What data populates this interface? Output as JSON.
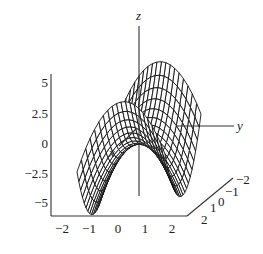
{
  "chart_data": {
    "type": "surface3d",
    "title": "",
    "function": "z = y^2 - x^2 (saddle / hyperbolic paraboloid)",
    "axes": {
      "x": {
        "label": "x",
        "ticks": [
          "2",
          "1",
          "0",
          "−1",
          "−2"
        ],
        "range": [
          -2,
          2
        ]
      },
      "y": {
        "label": "y",
        "ticks": [
          "−2",
          "−1",
          "0",
          "1",
          "2"
        ],
        "range": [
          -2,
          2
        ]
      },
      "z": {
        "label": "z",
        "ticks": [
          "5",
          "2.5",
          "0",
          "−2.5",
          "−5"
        ],
        "range": [
          -5,
          5
        ]
      }
    },
    "grid": false,
    "style": "wireframe mesh, black lines on white",
    "mesh_resolution": 20
  },
  "labels": {
    "z_axis": "z",
    "y_axis": "y",
    "x_axis": "x",
    "z_ticks": [
      "5",
      "2.5",
      "0",
      "−2.5",
      "−5"
    ],
    "bottom_ticks": [
      "−2",
      "−1",
      "0",
      "1",
      "2"
    ],
    "depth_ticks": [
      "2",
      "1",
      "0",
      "−1",
      "−2"
    ]
  }
}
